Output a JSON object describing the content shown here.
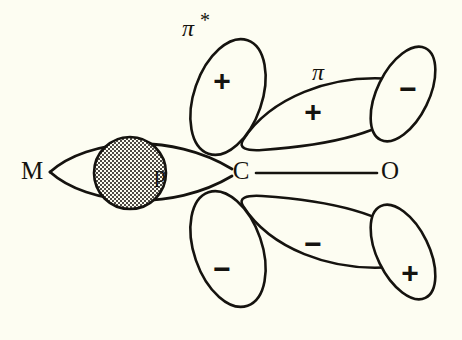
{
  "figure": {
    "background_color": "#fdfdf2",
    "ink_color": "#15130f"
  },
  "atoms": {
    "metal": {
      "label": "M",
      "x": 32,
      "y": 172
    },
    "carbon": {
      "label": "C",
      "x": 241,
      "y": 172
    },
    "oxygen": {
      "label": "O",
      "x": 390,
      "y": 172
    }
  },
  "bond": {
    "name": "carbon-oxygen-bond",
    "from": "C",
    "to": "O"
  },
  "sigma_donation": {
    "orbital_label": "p",
    "orbital_label_x": 160,
    "orbital_label_y": 175,
    "lens_from_x": 50,
    "lens_to_x": 232,
    "shaded_circle": {
      "name": "stippled-metal-orbital-circle",
      "cx": 130,
      "cy": 173,
      "r": 36
    }
  },
  "orbital_labels": {
    "pi_star": {
      "text": "π",
      "superscript": "*",
      "x": 193,
      "y": 28
    },
    "pi": {
      "text": "π",
      "x": 318,
      "y": 72
    }
  },
  "lobes": [
    {
      "name": "pi-star-upper-left-lobe",
      "sign": "+",
      "sign_x": 222,
      "sign_y": 80,
      "region": "top"
    },
    {
      "name": "pi-upper-middle-lobe",
      "sign": "+",
      "sign_x": 313,
      "sign_y": 111,
      "region": "top"
    },
    {
      "name": "pi-upper-right-lobe",
      "sign": "−",
      "sign_x": 408,
      "sign_y": 88,
      "region": "top"
    },
    {
      "name": "pi-star-lower-left-lobe",
      "sign": "−",
      "sign_x": 222,
      "sign_y": 268,
      "region": "bottom"
    },
    {
      "name": "pi-lower-middle-lobe",
      "sign": "−",
      "sign_x": 313,
      "sign_y": 243,
      "region": "bottom"
    },
    {
      "name": "pi-lower-right-lobe",
      "sign": "+",
      "sign_x": 410,
      "sign_y": 272,
      "region": "bottom"
    }
  ]
}
